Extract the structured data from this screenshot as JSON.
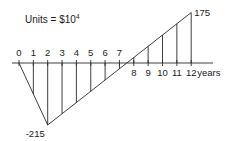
{
  "units_label": "Units = $10",
  "units_exponent": "4",
  "axis": {
    "unit_label": "years",
    "tick_labels": [
      "0",
      "1",
      "2",
      "3",
      "4",
      "5",
      "6",
      "7",
      "8",
      "9",
      "10",
      "11",
      "12"
    ]
  },
  "annotations": {
    "min_label": "-215",
    "max_label": "175"
  },
  "chart_data": {
    "type": "line",
    "units": "Units = $10^4",
    "xlabel": "years",
    "ylabel": "",
    "x": [
      0,
      1,
      2,
      3,
      4,
      5,
      6,
      7,
      8,
      9,
      10,
      11,
      12
    ],
    "series": [
      {
        "name": "cumulative cash flow",
        "values": [
          0,
          -107.5,
          -215,
          -176,
          -137,
          -98,
          -59,
          -20,
          19,
          58,
          97,
          136,
          175
        ]
      }
    ],
    "key_points": [
      {
        "x": 0,
        "y": 0
      },
      {
        "x": 2,
        "y": -215,
        "label": "-215"
      },
      {
        "x": 12,
        "y": 175,
        "label": "175"
      }
    ],
    "xlim": [
      0,
      12
    ],
    "ylim": [
      -215,
      175
    ],
    "grid": false,
    "legend": "none",
    "hatching": "vertical lines at each integer year from axis to curve"
  }
}
